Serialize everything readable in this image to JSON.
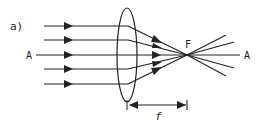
{
  "figure": {
    "panel_label": "a)",
    "incoming_axis_label": "A",
    "outgoing_axis_label": "A",
    "focal_point_label": "F",
    "focal_length_label": "f",
    "colors": {
      "stroke": "#222222",
      "background": "#ffffff"
    }
  }
}
